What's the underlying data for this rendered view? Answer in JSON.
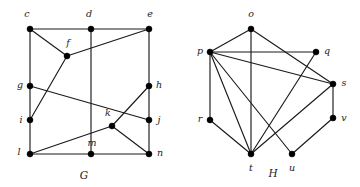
{
  "figure": {
    "width": 360,
    "height": 187,
    "background": "#ffffff",
    "ink_color": "#1a1a1a",
    "vertex_color": "#000000"
  },
  "graphs": [
    {
      "id": "G",
      "caption": "G",
      "caption_pos": {
        "x": 84,
        "y": 176
      },
      "vertex_radius": 3.0,
      "vertices": [
        {
          "id": "c",
          "label": "c",
          "x": 30,
          "y": 29,
          "label_x": 27,
          "label_y": 14,
          "anchor": "middle"
        },
        {
          "id": "d",
          "label": "d",
          "x": 91,
          "y": 29,
          "label_x": 89,
          "label_y": 14,
          "anchor": "middle"
        },
        {
          "id": "e",
          "label": "e",
          "x": 149,
          "y": 29,
          "label_x": 150,
          "label_y": 14,
          "anchor": "middle"
        },
        {
          "id": "f",
          "label": "f",
          "x": 67,
          "y": 56,
          "label_x": 68,
          "label_y": 43,
          "anchor": "middle"
        },
        {
          "id": "g",
          "label": "g",
          "x": 30,
          "y": 86,
          "label_x": 20,
          "label_y": 85,
          "anchor": "middle"
        },
        {
          "id": "h",
          "label": "h",
          "x": 149,
          "y": 86,
          "label_x": 159,
          "label_y": 85,
          "anchor": "middle"
        },
        {
          "id": "i",
          "label": "i",
          "x": 30,
          "y": 120,
          "label_x": 21,
          "label_y": 120,
          "anchor": "middle"
        },
        {
          "id": "j",
          "label": "j",
          "x": 149,
          "y": 120,
          "label_x": 159,
          "label_y": 120,
          "anchor": "middle"
        },
        {
          "id": "k",
          "label": "k",
          "x": 112,
          "y": 126,
          "label_x": 108,
          "label_y": 113,
          "anchor": "middle"
        },
        {
          "id": "l",
          "label": "l",
          "x": 30,
          "y": 154,
          "label_x": 19,
          "label_y": 152,
          "anchor": "middle"
        },
        {
          "id": "m",
          "label": "m",
          "x": 91,
          "y": 154,
          "label_x": 92,
          "label_y": 143,
          "anchor": "middle"
        },
        {
          "id": "n",
          "label": "n",
          "x": 149,
          "y": 154,
          "label_x": 160,
          "label_y": 153,
          "anchor": "middle"
        }
      ],
      "edges": [
        [
          "c",
          "d"
        ],
        [
          "d",
          "e"
        ],
        [
          "c",
          "f"
        ],
        [
          "f",
          "e"
        ],
        [
          "c",
          "g"
        ],
        [
          "g",
          "i"
        ],
        [
          "i",
          "l"
        ],
        [
          "e",
          "h"
        ],
        [
          "h",
          "j"
        ],
        [
          "j",
          "n"
        ],
        [
          "l",
          "m"
        ],
        [
          "m",
          "n"
        ],
        [
          "d",
          "m"
        ],
        [
          "f",
          "i"
        ],
        [
          "g",
          "j"
        ],
        [
          "l",
          "k"
        ],
        [
          "k",
          "h"
        ],
        [
          "k",
          "n"
        ]
      ]
    },
    {
      "id": "H",
      "caption": "H",
      "caption_pos": {
        "x": 273,
        "y": 174
      },
      "vertex_radius": 3.0,
      "vertices": [
        {
          "id": "o",
          "label": "o",
          "x": 251,
          "y": 29,
          "label_x": 251,
          "label_y": 14,
          "anchor": "middle"
        },
        {
          "id": "p",
          "label": "p",
          "x": 210,
          "y": 52,
          "label_x": 200,
          "label_y": 51,
          "anchor": "middle"
        },
        {
          "id": "q",
          "label": "q",
          "x": 316,
          "y": 52,
          "label_x": 327,
          "label_y": 51,
          "anchor": "middle"
        },
        {
          "id": "s",
          "label": "s",
          "x": 333,
          "y": 84,
          "label_x": 344,
          "label_y": 83,
          "anchor": "middle"
        },
        {
          "id": "r",
          "label": "r",
          "x": 210,
          "y": 120,
          "label_x": 200,
          "label_y": 119,
          "anchor": "middle"
        },
        {
          "id": "v",
          "label": "v",
          "x": 333,
          "y": 118,
          "label_x": 344,
          "label_y": 118,
          "anchor": "middle"
        },
        {
          "id": "t",
          "label": "t",
          "x": 251,
          "y": 154,
          "label_x": 251,
          "label_y": 168,
          "anchor": "middle"
        },
        {
          "id": "u",
          "label": "u",
          "x": 292,
          "y": 154,
          "label_x": 292,
          "label_y": 168,
          "anchor": "middle"
        }
      ],
      "edges": [
        [
          "o",
          "p"
        ],
        [
          "o",
          "t"
        ],
        [
          "o",
          "s"
        ],
        [
          "p",
          "q"
        ],
        [
          "p",
          "r"
        ],
        [
          "p",
          "s"
        ],
        [
          "p",
          "t"
        ],
        [
          "p",
          "u"
        ],
        [
          "q",
          "t"
        ],
        [
          "s",
          "v"
        ],
        [
          "s",
          "t"
        ],
        [
          "v",
          "u"
        ],
        [
          "r",
          "t"
        ]
      ]
    }
  ]
}
